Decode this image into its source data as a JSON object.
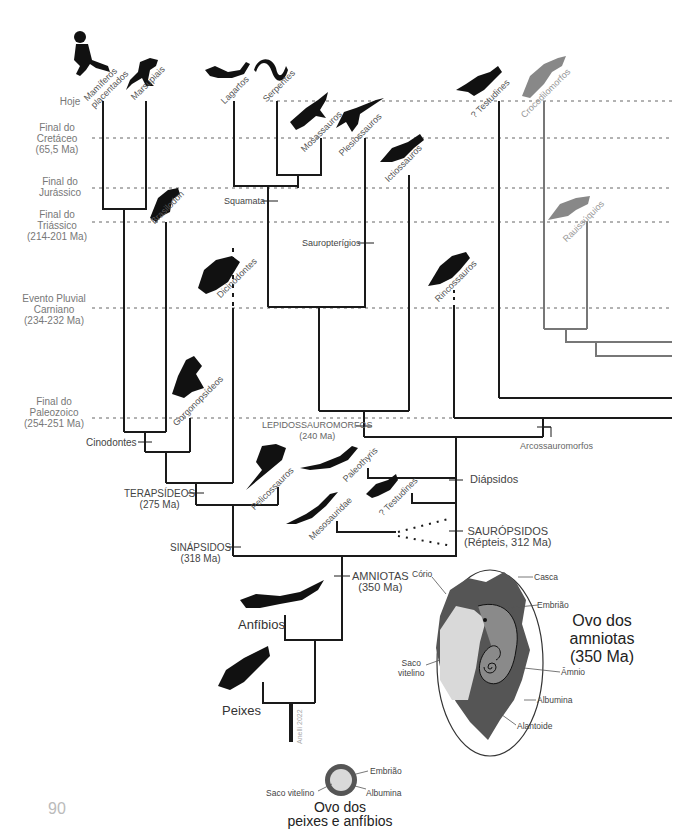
{
  "page_number": "90",
  "timeline": [
    {
      "id": "hoje",
      "label": "Hoje",
      "y": 101
    },
    {
      "id": "cretaceo",
      "label": "Final do\nCretáceo\n(65,5 Ma)",
      "y": 138
    },
    {
      "id": "jurassico",
      "label": "Final do\nJurássico",
      "y": 188
    },
    {
      "id": "triassico",
      "label": "Final do\nTriássico\n(214-201 Ma)",
      "y": 222
    },
    {
      "id": "carniano",
      "label": "Evento Pluvial\nCarniano\n(234-232 Ma)",
      "y": 308
    },
    {
      "id": "paleozoico",
      "label": "Final do\nPaleozoico\n(254-251 Ma)",
      "y": 418
    }
  ],
  "taxa": [
    {
      "id": "mamiferos-placentados",
      "label": "Mamíferos\nplacentados",
      "silhouette": "human-child-running"
    },
    {
      "id": "marsupiais",
      "label": "Marsupiais",
      "silhouette": "kangaroo"
    },
    {
      "id": "brasilodon",
      "label": "Brasilodon",
      "silhouette": "small-mammaliform"
    },
    {
      "id": "dicinodontes",
      "label": "Dicinodontes",
      "silhouette": "dicynodont"
    },
    {
      "id": "gorgonopsideos",
      "label": "Gorgonopsídeos",
      "silhouette": "gorgonopsid"
    },
    {
      "id": "lagartos",
      "label": "Lagartos",
      "silhouette": "lizard"
    },
    {
      "id": "serpentes",
      "label": "Serpentes",
      "silhouette": "snake"
    },
    {
      "id": "mosassauros",
      "label": "Mosassauros",
      "silhouette": "mosasaur"
    },
    {
      "id": "plesiossauros",
      "label": "Plesiossauros",
      "silhouette": "plesiosaur"
    },
    {
      "id": "ictiossauros",
      "label": "Ictiossauros",
      "silhouette": "ichthyosaur"
    },
    {
      "id": "rincossauros",
      "label": "Rincossauros",
      "silhouette": "rhynchosaur"
    },
    {
      "id": "testudines-top",
      "label": "? Testudines",
      "silhouette": "turtle"
    },
    {
      "id": "crocodilomorfos",
      "label": "Crocodilomorfos",
      "silhouette": "crocodile"
    },
    {
      "id": "rauissuquios",
      "label": "Rauissúquios",
      "silhouette": "rauisuchian"
    },
    {
      "id": "pelicossauros",
      "label": "Pelicossauros",
      "silhouette": "dimetrodon"
    },
    {
      "id": "paleothyris",
      "label": "Paleothyris",
      "silhouette": "small-lizard"
    },
    {
      "id": "testudines-bottom",
      "label": "? Testudines",
      "silhouette": "turtle"
    },
    {
      "id": "mesosauridae",
      "label": "Mesosauridae",
      "silhouette": "mesosaur"
    }
  ],
  "nodes": {
    "squamata": "Squamata",
    "sauropterigios": "Sauropterígios",
    "cinodontes": "Cinodontes",
    "terapsideos": "TERAPSÍDEOS",
    "terapsideos_age": "(275 Ma)",
    "sinapsidos": "SINÁPSIDOS",
    "sinapsidos_age": "(318 Ma)",
    "lepidossauromorfos": "LEPIDOSSAUROMORFOS",
    "lepidossauromorfos_age": "(240 Ma)",
    "arcossauromorfos": "Arcossauromorfos",
    "diapsidos": "Diápsidos",
    "saurópsidos": "SAURÓPSIDOS",
    "saurópsidos_age": "(Répteis, 312 Ma)",
    "amniotas": "AMNIOTAS",
    "amniotas_age": "(350 Ma)"
  },
  "base_groups": {
    "anfibios": "Anfíbios",
    "peixes": "Peixes",
    "credit": "Anelli 2022"
  },
  "amniote_egg": {
    "title": "Ovo dos\namniotas\n(350 Ma)",
    "labels": {
      "corio": "Cório",
      "casca": "Casca",
      "embriao": "Embrião",
      "saco_vitelino": "Saco\nvitelino",
      "amnio": "Âmnio",
      "albumina": "Albumina",
      "alantoide": "Alantoide"
    },
    "colors": {
      "chorion": "#555555",
      "yolk": "#d9d9d9",
      "amnion": "#8a8a8a",
      "shell": "#ffffff"
    }
  },
  "fish_egg": {
    "title": "Ovo dos\npeixes e anfíbios",
    "labels": {
      "embriao": "Embrião",
      "saco_vitelino": "Saco vitelino",
      "albumina": "Albumina"
    }
  },
  "colors": {
    "line": "#1a1a1a",
    "grey_line": "#777777",
    "dash": "#666666",
    "silhouette": "#111111",
    "grey_silhouette": "#888888"
  }
}
